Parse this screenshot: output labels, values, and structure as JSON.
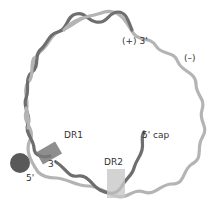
{
  "diagram": {
    "type": "circular genome schematic",
    "colors": {
      "plus_strand": "#6e6e6e",
      "minus_strand": "#b4b4b4",
      "protein": "#595959",
      "dr1_box": "#7a7a7a",
      "dr2_box": "#c8c8c8",
      "text": "#333333"
    },
    "labels": {
      "plus_strand_3prime": "(+) 3'",
      "minus_strand": "(–)",
      "dr1": "DR1",
      "dr2": "DR2",
      "cap": "5' cap",
      "minus_3prime": "3'",
      "minus_5prime": "5'"
    }
  }
}
